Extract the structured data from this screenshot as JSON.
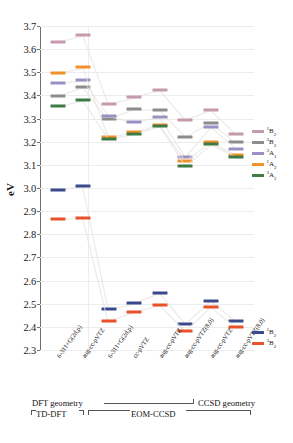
{
  "chart_data": {
    "type": "scatter",
    "title": "",
    "xlabel": "",
    "ylabel": "eV",
    "ylim": [
      2.3,
      3.7
    ],
    "yticks": [
      "3.7",
      "3.6",
      "3.5",
      "3.4",
      "3.3",
      "3.2",
      "3.1",
      "3.0",
      "2.9",
      "2.8",
      "2.7",
      "2.6",
      "2.5",
      "2.4",
      "2.3"
    ],
    "grid": true,
    "legend_position": "right",
    "categories": [
      "6-311+G(2d,p)",
      "aug-cc-pVTZ",
      "6-311+G(2d,p)",
      "cc-pVTZ",
      "aug-cc-pVTZ",
      "aug-cc-pVTZ(8,0)",
      "aug-cc-pVTZ",
      "aug-cc-pVTZ(8,0)"
    ],
    "series": [
      {
        "name": "1B2-upper",
        "label": "¹B₂",
        "color": "#c49aae",
        "values": [
          3.633,
          3.662,
          3.365,
          3.392,
          3.422,
          3.294,
          3.338,
          3.232
        ]
      },
      {
        "name": "3B2-upper",
        "label": "³B₂",
        "color": "#8c8c8c",
        "values": [
          3.398,
          3.438,
          3.296,
          3.341,
          3.335,
          3.221,
          3.283,
          3.197
        ]
      },
      {
        "name": "3A1-upper",
        "label": "³A₁",
        "color": "#9b8fc4",
        "values": [
          3.455,
          3.466,
          3.313,
          3.285,
          3.307,
          3.135,
          3.263,
          3.17
        ]
      },
      {
        "name": "1A2-upper",
        "label": "¹A₂",
        "color": "#f0922b",
        "values": [
          3.499,
          3.521,
          3.22,
          3.24,
          3.272,
          3.118,
          3.199,
          3.143
        ]
      },
      {
        "name": "3A2-upper",
        "label": "³A₂",
        "color": "#3e7a43",
        "values": [
          3.355,
          3.379,
          3.212,
          3.233,
          3.266,
          3.097,
          3.188,
          3.133
        ]
      },
      {
        "name": "1B2-lower",
        "label": "¹B₂",
        "color": "#3b4a8c",
        "values": [
          2.99,
          3.008,
          2.478,
          2.501,
          2.545,
          2.412,
          2.512,
          2.424
        ]
      },
      {
        "name": "3B2-lower",
        "label": "³B₂",
        "color": "#e8512a",
        "values": [
          2.866,
          2.872,
          2.425,
          2.466,
          2.496,
          2.383,
          2.486,
          2.398
        ]
      }
    ],
    "legend_upper": [
      {
        "label": "¹B₂",
        "sup": "1",
        "base": "B",
        "sub": "2",
        "color": "#c49aae"
      },
      {
        "label": "³B₂",
        "sup": "3",
        "base": "B",
        "sub": "2",
        "color": "#8c8c8c"
      },
      {
        "label": "³A₁",
        "sup": "3",
        "base": "A",
        "sub": "1",
        "color": "#9b8fc4"
      },
      {
        "label": "¹A₂",
        "sup": "1",
        "base": "A",
        "sub": "2",
        "color": "#f0922b"
      },
      {
        "label": "³A₂",
        "sup": "3",
        "base": "A",
        "sub": "2",
        "color": "#3e7a43"
      }
    ],
    "legend_lower": [
      {
        "label": "¹B₂",
        "sup": "1",
        "base": "B",
        "sub": "2",
        "color": "#3b4a8c"
      },
      {
        "label": "³B₂",
        "sup": "3",
        "base": "B",
        "sub": "2",
        "color": "#e8512a"
      }
    ]
  },
  "annotations": {
    "dft_geometry": "DFT geometry",
    "ccsd_geometry": "CCSD geometry",
    "td_dft": "TD-DFT",
    "eom_ccsd": "EOM-CCSD"
  }
}
